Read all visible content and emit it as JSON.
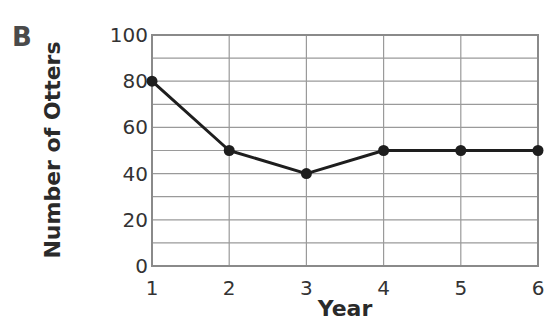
{
  "panel_label": "B",
  "chart_data": {
    "type": "line",
    "title": "",
    "xlabel": "Year",
    "ylabel": "Number of Otters",
    "categories": [
      "1",
      "2",
      "3",
      "4",
      "5",
      "6"
    ],
    "x": [
      1,
      2,
      3,
      4,
      5,
      6
    ],
    "series": [
      {
        "name": "Otters",
        "values": [
          80,
          50,
          40,
          50,
          50,
          50
        ]
      }
    ],
    "xlim": [
      1,
      6
    ],
    "ylim": [
      0,
      100
    ],
    "yticks": [
      0,
      20,
      40,
      60,
      80,
      100
    ],
    "xticks": [
      1,
      2,
      3,
      4,
      5,
      6
    ],
    "grid": {
      "on": true,
      "y_step": 10,
      "x_step": 1
    },
    "legend": "none",
    "markers": "filled-circle"
  }
}
